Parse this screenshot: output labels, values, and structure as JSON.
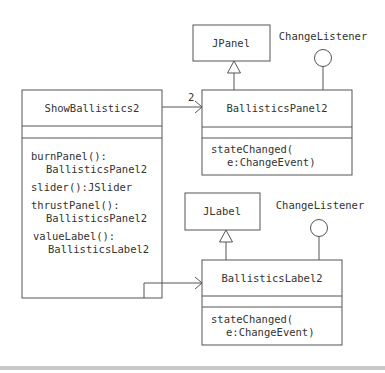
{
  "diagram": {
    "type": "uml-class-diagram",
    "classes": {
      "show_ballistics": {
        "name": "ShowBallistics2",
        "operations": [
          {
            "line1": "burnPanel():",
            "line2": "BallisticsPanel2"
          },
          {
            "line1": "slider():JSlider",
            "line2": ""
          },
          {
            "line1": "thrustPanel():",
            "line2": "BallisticsPanel2"
          },
          {
            "line1": "valueLabel():",
            "line2": "BallisticsLabel2"
          }
        ]
      },
      "ballistics_panel": {
        "name": "BallisticsPanel2",
        "operations": [
          {
            "line1": "stateChanged(",
            "line2": "e:ChangeEvent)"
          }
        ]
      },
      "ballistics_label": {
        "name": "BallisticsLabel2",
        "operations": [
          {
            "line1": "stateChanged(",
            "line2": "e:ChangeEvent)"
          }
        ]
      },
      "jpanel": {
        "name": "JPanel"
      },
      "jlabel": {
        "name": "JLabel"
      }
    },
    "interfaces": {
      "panel_listener": {
        "name": "ChangeListener"
      },
      "label_listener": {
        "name": "ChangeListener"
      }
    },
    "associations": {
      "to_panel": {
        "multiplicity": "2",
        "from": "ShowBallistics2",
        "to": "BallisticsPanel2"
      },
      "to_label": {
        "multiplicity": "",
        "from": "ShowBallistics2",
        "to": "BallisticsLabel2"
      }
    },
    "generalizations": [
      {
        "child": "BallisticsPanel2",
        "parent": "JPanel"
      },
      {
        "child": "BallisticsLabel2",
        "parent": "JLabel"
      }
    ],
    "realizations": [
      {
        "class": "BallisticsPanel2",
        "interface": "ChangeListener"
      },
      {
        "class": "BallisticsLabel2",
        "interface": "ChangeListener"
      }
    ],
    "colors": {
      "stroke": "#555555",
      "text": "#333333",
      "bottom_bar": "#c8c8c8"
    }
  }
}
